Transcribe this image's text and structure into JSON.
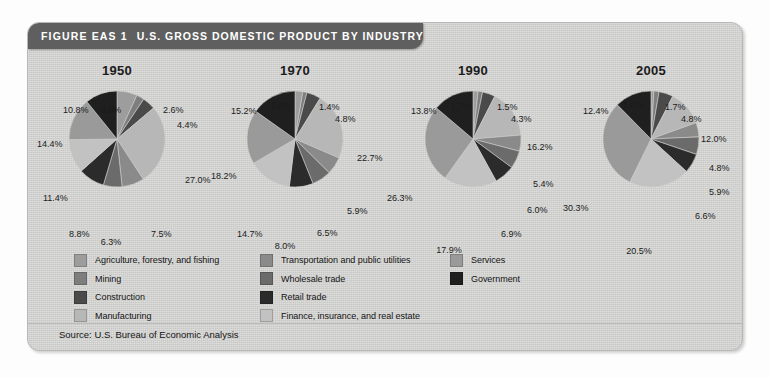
{
  "figure": {
    "label": "FIGURE EAS 1",
    "title": "U.S. GROSS DOMESTIC PRODUCT BY INDUSTRY",
    "source": "Source: U.S. Bureau of Economic Analysis",
    "background_color": "#d6d6d4",
    "header_color": "#5f5f5f",
    "header_text_color": "#ffffff"
  },
  "legend": {
    "columns": [
      {
        "items": [
          {
            "label": "Agriculture, forestry, and fishing",
            "color": "#9d9d9d"
          },
          {
            "label": "Mining",
            "color": "#7e7e7e"
          },
          {
            "label": "Construction",
            "color": "#4a4a4a"
          },
          {
            "label": "Manufacturing",
            "color": "#b7b7b7"
          }
        ]
      },
      {
        "items": [
          {
            "label": "Transportation and public utilities",
            "color": "#8a8a8a"
          },
          {
            "label": "Wholesale trade",
            "color": "#6b6b6b"
          },
          {
            "label": "Retail trade",
            "color": "#2b2b2b"
          },
          {
            "label": "Finance, insurance, and real estate",
            "color": "#c2c2c2"
          }
        ]
      },
      {
        "items": [
          {
            "label": "Services",
            "color": "#9a9a9a"
          },
          {
            "label": "Government",
            "color": "#1f1f1f"
          }
        ]
      }
    ]
  },
  "chart_data": {
    "type": "pie",
    "title": "U.S. GROSS DOMESTIC PRODUCT BY INDUSTRY",
    "xlabel": "",
    "ylabel": "",
    "units": "percent of GDP",
    "legend_position": "bottom",
    "grid": false,
    "categories": [
      "Agriculture, forestry, and fishing",
      "Mining",
      "Construction",
      "Manufacturing",
      "Transportation and public utilities",
      "Wholesale trade",
      "Retail trade",
      "Finance, insurance, and real estate",
      "Services",
      "Government"
    ],
    "category_colors": [
      "#9d9d9d",
      "#7e7e7e",
      "#4a4a4a",
      "#b7b7b7",
      "#8a8a8a",
      "#6b6b6b",
      "#2b2b2b",
      "#c2c2c2",
      "#9a9a9a",
      "#1f1f1f"
    ],
    "series": [
      {
        "name": "1950",
        "values": [
          6.8,
          2.6,
          4.4,
          27.0,
          7.5,
          6.3,
          8.8,
          11.4,
          14.4,
          10.8
        ],
        "labels": [
          "6.8%",
          "2.6%",
          "4.4%",
          "27.0%",
          "7.5%",
          "6.3%",
          "8.8%",
          "11.4%",
          "14.4%",
          "10.8%"
        ]
      },
      {
        "name": "1970",
        "values": [
          2.6,
          1.4,
          4.8,
          22.7,
          5.9,
          6.5,
          8.0,
          14.7,
          18.2,
          15.2
        ],
        "labels": [
          "2.6%",
          "1.4%",
          "4.8%",
          "22.7%",
          "5.9%",
          "6.5%",
          "8.0%",
          "14.7%",
          "18.2%",
          "15.2%"
        ]
      },
      {
        "name": "1990",
        "values": [
          1.7,
          1.5,
          4.3,
          16.2,
          5.4,
          6.0,
          6.9,
          17.9,
          26.3,
          13.8
        ],
        "labels": [
          "1.7%",
          "1.5%",
          "4.3%",
          "16.2%",
          "5.4%",
          "6.0%",
          "6.9%",
          "17.9%",
          "26.3%",
          "13.8%"
        ]
      },
      {
        "name": "2005",
        "values": [
          1.0,
          1.7,
          4.8,
          12.0,
          4.8,
          5.9,
          6.6,
          20.5,
          30.3,
          12.4
        ],
        "labels": [
          "1.0%",
          "1.7%",
          "4.8%",
          "12.0%",
          "4.8%",
          "5.9%",
          "6.6%",
          "20.5%",
          "30.3%",
          "12.4%"
        ]
      }
    ]
  },
  "pies": [
    {
      "year": "1950",
      "label_positions": [
        {
          "text": "6.8%",
          "x": 44,
          "y": 22,
          "anchor": "middle"
        },
        {
          "text": "2.6%",
          "x": 96,
          "y": 22,
          "anchor": "start"
        },
        {
          "text": "4.4%",
          "x": 110,
          "y": 37,
          "anchor": "start"
        },
        {
          "text": "27.0%",
          "x": 118,
          "y": 92,
          "anchor": "start"
        },
        {
          "text": "7.5%",
          "x": 84,
          "y": 146,
          "anchor": "start"
        },
        {
          "text": "6.3%",
          "x": 44,
          "y": 154,
          "anchor": "middle"
        },
        {
          "text": "8.8%",
          "x": 2,
          "y": 146,
          "anchor": "start"
        },
        {
          "text": "11.4%",
          "x": -24,
          "y": 110,
          "anchor": "start"
        },
        {
          "text": "14.4%",
          "x": -30,
          "y": 56,
          "anchor": "start"
        },
        {
          "text": "10.8%",
          "x": -4,
          "y": 22,
          "anchor": "start"
        }
      ]
    },
    {
      "year": "1970",
      "label_positions": [
        {
          "text": "2.6%",
          "x": 36,
          "y": 18,
          "anchor": "middle"
        },
        {
          "text": "1.4%",
          "x": 74,
          "y": 19,
          "anchor": "start"
        },
        {
          "text": "4.8%",
          "x": 90,
          "y": 31,
          "anchor": "start"
        },
        {
          "text": "22.7%",
          "x": 112,
          "y": 70,
          "anchor": "start"
        },
        {
          "text": "5.9%",
          "x": 102,
          "y": 123,
          "anchor": "start"
        },
        {
          "text": "6.5%",
          "x": 72,
          "y": 145,
          "anchor": "start"
        },
        {
          "text": "8.0%",
          "x": 40,
          "y": 158,
          "anchor": "middle"
        },
        {
          "text": "14.7%",
          "x": -8,
          "y": 146,
          "anchor": "start"
        },
        {
          "text": "18.2%",
          "x": -34,
          "y": 88,
          "anchor": "start"
        },
        {
          "text": "15.2%",
          "x": -14,
          "y": 23,
          "anchor": "start"
        }
      ]
    },
    {
      "year": "1990",
      "label_positions": [
        {
          "text": "1.7%",
          "x": 38,
          "y": 18,
          "anchor": "middle"
        },
        {
          "text": "1.5%",
          "x": 74,
          "y": 19,
          "anchor": "start"
        },
        {
          "text": "4.3%",
          "x": 88,
          "y": 31,
          "anchor": "start"
        },
        {
          "text": "16.2%",
          "x": 104,
          "y": 59,
          "anchor": "start"
        },
        {
          "text": "5.4%",
          "x": 110,
          "y": 96,
          "anchor": "start"
        },
        {
          "text": "6.0%",
          "x": 104,
          "y": 122,
          "anchor": "start"
        },
        {
          "text": "6.9%",
          "x": 78,
          "y": 146,
          "anchor": "start"
        },
        {
          "text": "17.9%",
          "x": 26,
          "y": 162,
          "anchor": "middle"
        },
        {
          "text": "26.3%",
          "x": -36,
          "y": 110,
          "anchor": "start"
        },
        {
          "text": "13.8%",
          "x": -12,
          "y": 23,
          "anchor": "start"
        }
      ]
    },
    {
      "year": "2005",
      "label_positions": [
        {
          "text": "1.0%",
          "x": 32,
          "y": 17,
          "anchor": "middle"
        },
        {
          "text": "1.7%",
          "x": 64,
          "y": 19,
          "anchor": "start"
        },
        {
          "text": "4.8%",
          "x": 80,
          "y": 31,
          "anchor": "start"
        },
        {
          "text": "12.0%",
          "x": 100,
          "y": 51,
          "anchor": "start"
        },
        {
          "text": "4.8%",
          "x": 108,
          "y": 80,
          "anchor": "start"
        },
        {
          "text": "5.9%",
          "x": 108,
          "y": 104,
          "anchor": "start"
        },
        {
          "text": "6.6%",
          "x": 94,
          "y": 128,
          "anchor": "start"
        },
        {
          "text": "20.5%",
          "x": 38,
          "y": 163,
          "anchor": "middle"
        },
        {
          "text": "30.3%",
          "x": -38,
          "y": 120,
          "anchor": "start"
        },
        {
          "text": "12.4%",
          "x": -18,
          "y": 23,
          "anchor": "start"
        }
      ]
    }
  ]
}
